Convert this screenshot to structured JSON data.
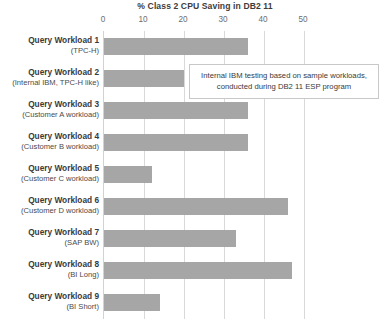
{
  "chart_data": {
    "type": "bar",
    "orientation": "horizontal",
    "title": "% Class 2 CPU Saving in DB2 11",
    "xlabel": "",
    "ylabel": "",
    "xlim": [
      0,
      55
    ],
    "grid": true,
    "legend": "none",
    "xticks": [
      0,
      10,
      20,
      30,
      40,
      50
    ],
    "xtick_labels": [
      "0",
      "10",
      "20",
      "30",
      "40",
      "50"
    ],
    "categories": [
      "Query Workload 1 (TPC-H)",
      "Query Workload 2 (Internal IBM, TPC-H like)",
      "Query Workload 3 (Customer A workload)",
      "Query Workload 4 (Customer B workload)",
      "Query Workload 5 (Customer C workload)",
      "Query Workload 6 (Customer D workload)",
      "Query Workload 7 (SAP BW)",
      "Query Workload 8 (BI Long)",
      "Query Workload 9 (BI Short)"
    ],
    "category_lines": [
      {
        "line1": "Query Workload 1",
        "line2": "(TPC-H)"
      },
      {
        "line1": "Query Workload 2",
        "line2": "(Internal IBM, TPC-H like)"
      },
      {
        "line1": "Query Workload 3",
        "line2": "(Customer A workload)"
      },
      {
        "line1": "Query Workload 4",
        "line2": "(Customer B workload)"
      },
      {
        "line1": "Query Workload 5",
        "line2": "(Customer C workload)"
      },
      {
        "line1": "Query Workload 6",
        "line2": "(Customer D workload)"
      },
      {
        "line1": "Query Workload 7",
        "line2": "(SAP BW)"
      },
      {
        "line1": "Query Workload 8",
        "line2": "(BI Long)"
      },
      {
        "line1": "Query Workload 9",
        "line2": "(BI Short)"
      }
    ],
    "values": [
      36,
      20,
      36,
      36,
      12,
      46,
      33,
      47,
      14
    ],
    "bar_color": "#a6a6a6",
    "gridline_color": "#d9d9d9"
  },
  "annotation": {
    "line1": "Internal IBM testing based on sample workloads,",
    "line2": "conducted during DB2 11 ESP program"
  }
}
